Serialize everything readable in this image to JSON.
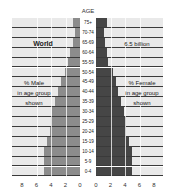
{
  "chart_data": {
    "type": "bar",
    "subtype": "population-pyramid",
    "title": "World",
    "subtitle": "6.5 billion",
    "xlabel_left": "% Male in age group shown",
    "xlabel_right": "% Female in age group shown",
    "ylabel": "AGE",
    "categories": [
      "75+",
      "70-74",
      "65-69",
      "60-64",
      "55-59",
      "50-54",
      "45-49",
      "40-44",
      "35-39",
      "30-34",
      "25-29",
      "20-24",
      "15-19",
      "10-14",
      "5-9",
      "0-4"
    ],
    "series": [
      {
        "name": "Male",
        "color": "#8c8c8c",
        "values": [
          0.9,
          0.7,
          1.0,
          1.4,
          1.6,
          2.1,
          2.6,
          3.0,
          3.4,
          3.8,
          4.0,
          4.2,
          4.6,
          5.0,
          5.0,
          4.95
        ]
      },
      {
        "name": "Female",
        "color": "#464646",
        "values": [
          1.45,
          1.1,
          1.3,
          1.5,
          1.7,
          2.3,
          2.7,
          3.0,
          3.5,
          3.8,
          4.1,
          4.2,
          4.5,
          4.9,
          4.9,
          4.9
        ]
      }
    ],
    "xticks_left": [
      "8",
      "6",
      "4",
      "2",
      "0"
    ],
    "xticks_right": [
      "0",
      "2",
      "4",
      "6",
      "8"
    ],
    "xlim": [
      0,
      8
    ],
    "grid": true
  },
  "labels": {
    "age_title": "AGE",
    "world": "World",
    "population": "6.5 billion",
    "male_line1": "% Male",
    "male_line2": "in age group",
    "male_line3": "shown",
    "female_line1": "% Female",
    "female_line2": "in age group",
    "female_line3": "shown"
  }
}
